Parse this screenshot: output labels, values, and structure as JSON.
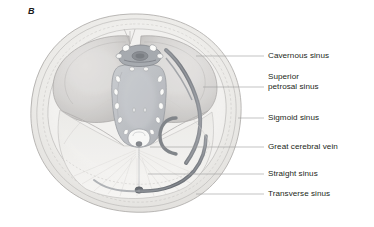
{
  "figure": {
    "panel_label": "B",
    "title_semantic": "superior view of cranial base dural venous sinuses",
    "view": "superior (axial) view of the cranial base",
    "background_color": "#ffffff",
    "ink_color": "#231f20",
    "leader_line_color": "#9a9a9a",
    "palette": {
      "bone_pale": "#eceae6",
      "fossa_grey": "#d6d4d2",
      "fossa_shadow": "#bdbbb9",
      "dura_mid": "#cfcdcb",
      "clivus_fill": "#b9bcc0",
      "sinus_dark": "#6e7278",
      "sinus_mid": "#8b8f95",
      "sinus_light": "#a8acb2",
      "nerve_white": "#fbfbf9",
      "outline_grey": "#8e8c8a",
      "tentorium_pale": "#e6e4e2"
    },
    "structures": [
      {
        "name": "skull-outline",
        "kind": "bone-rim"
      },
      {
        "name": "anterior-cranial-fossa-left",
        "kind": "fossa"
      },
      {
        "name": "anterior-cranial-fossa-right",
        "kind": "fossa"
      },
      {
        "name": "clivus-brainstem-oval",
        "kind": "central-oval"
      },
      {
        "name": "cranial-nerve-cross-sections",
        "kind": "nerve-ovals",
        "count": 14
      },
      {
        "name": "cavernous-sinus",
        "kind": "venous-sinus"
      },
      {
        "name": "superior-petrosal-sinus",
        "kind": "venous-sinus"
      },
      {
        "name": "sigmoid-sinus",
        "kind": "venous-sinus"
      },
      {
        "name": "great-cerebral-vein",
        "kind": "vein"
      },
      {
        "name": "straight-sinus",
        "kind": "venous-sinus"
      },
      {
        "name": "transverse-sinus",
        "kind": "venous-sinus"
      },
      {
        "name": "tentorium-cerebelli",
        "kind": "dural-fold"
      }
    ]
  },
  "labels": [
    {
      "id": "cavernous-sinus",
      "text": "Cavernous sinus",
      "x": 268,
      "y": 51,
      "leader_y": 56,
      "leader_x1": 196,
      "leader_x2": 264
    },
    {
      "id": "superior-petrosal-sinus",
      "text": "Superior\npetrosal sinus",
      "x": 268,
      "y": 77,
      "leader_y": 87,
      "leader_x1": 203,
      "leader_x2": 264
    },
    {
      "id": "sigmoid-sinus",
      "text": "Sigmoid sinus",
      "x": 268,
      "y": 114,
      "leader_y": 118,
      "leader_x1": 238,
      "leader_x2": 264
    },
    {
      "id": "great-cerebral-vein",
      "text": "Great cerebral vein",
      "x": 268,
      "y": 143,
      "leader_y": 147,
      "leader_x1": 150,
      "leader_x2": 264
    },
    {
      "id": "straight-sinus",
      "text": "Straight sinus",
      "x": 268,
      "y": 170,
      "leader_y": 174,
      "leader_x1": 148,
      "leader_x2": 264
    },
    {
      "id": "transverse-sinus",
      "text": "Transverse sinus",
      "x": 268,
      "y": 190,
      "leader_y": 194,
      "leader_x1": 196,
      "leader_x2": 264
    }
  ]
}
